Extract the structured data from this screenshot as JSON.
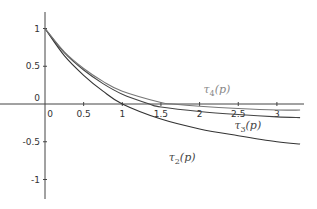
{
  "chart_data": {
    "type": "line",
    "title": "",
    "xlabel": "",
    "ylabel": "",
    "xlim": [
      -0.35,
      3.3
    ],
    "ylim": [
      -1.2,
      1.2
    ],
    "grid": false,
    "x_ticks": [
      0,
      0.5,
      1,
      1.5,
      2,
      2.5,
      3
    ],
    "x_tick_labels": [
      "0",
      "0.5",
      "1",
      "1.5",
      "2",
      "2.5",
      "3"
    ],
    "y_ticks": [
      1,
      0.5,
      0,
      -0.5,
      -1
    ],
    "y_tick_labels": [
      "1",
      "0.5",
      "0",
      "-0.5",
      "-1"
    ],
    "series": [
      {
        "name": "τ2(p)",
        "label_sub": "2",
        "color": "#333333",
        "x": [
          0,
          0.25,
          0.5,
          0.75,
          1,
          1.5,
          2,
          2.5,
          3,
          3.3
        ],
        "values": [
          1,
          0.64,
          0.38,
          0.17,
          0,
          -0.2,
          -0.33,
          -0.42,
          -0.5,
          -0.53
        ],
        "label_pos": [
          1.6,
          -0.75
        ]
      },
      {
        "name": "τ3(p)",
        "label_sub": "3",
        "color": "#444444",
        "x": [
          0,
          0.25,
          0.5,
          0.75,
          1,
          1.35,
          1.5,
          2,
          2.5,
          3,
          3.3
        ],
        "values": [
          1,
          0.68,
          0.45,
          0.27,
          0.13,
          0,
          -0.04,
          -0.1,
          -0.14,
          -0.17,
          -0.18
        ],
        "label_pos": [
          2.45,
          -0.33
        ]
      },
      {
        "name": "τ4(p)",
        "label_sub": "4",
        "color": "#777777",
        "x": [
          0,
          0.25,
          0.5,
          0.75,
          1,
          1.5,
          1.65,
          2,
          2.5,
          3,
          3.3
        ],
        "values": [
          1,
          0.69,
          0.47,
          0.3,
          0.17,
          0.02,
          0,
          -0.03,
          -0.06,
          -0.08,
          -0.08
        ],
        "label_pos": [
          2.05,
          0.15
        ]
      }
    ]
  }
}
